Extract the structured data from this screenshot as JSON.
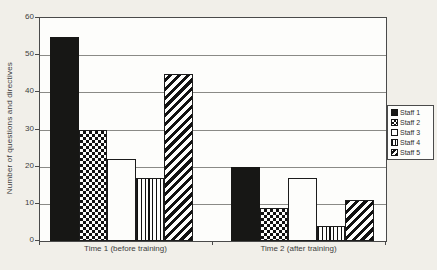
{
  "colors": {
    "background": "#f1efe9",
    "plot_background": "#fdfdfb",
    "bar_black": "#171715",
    "line": "#4a4a4a",
    "gridline": "#8a8a86"
  },
  "chart_data": {
    "type": "bar",
    "title": "",
    "xlabel": "",
    "ylabel": "Number of questions and directives",
    "categories": [
      "Time 1 (before training)",
      "Time 2 (after training)"
    ],
    "series": [
      {
        "name": "Staff 1",
        "pattern": "solid-black",
        "values": [
          55,
          20
        ]
      },
      {
        "name": "Staff 2",
        "pattern": "checkerboard",
        "values": [
          30,
          9
        ]
      },
      {
        "name": "Staff 3",
        "pattern": "white",
        "values": [
          22,
          17
        ]
      },
      {
        "name": "Staff 4",
        "pattern": "vertical-lines",
        "values": [
          17,
          4
        ]
      },
      {
        "name": "Staff 5",
        "pattern": "diagonal-stripes",
        "values": [
          45,
          11
        ]
      }
    ],
    "ylim": [
      0,
      60
    ],
    "yticks": [
      0,
      10,
      20,
      30,
      40,
      50,
      60
    ],
    "grid": true,
    "legend_position": "right"
  }
}
